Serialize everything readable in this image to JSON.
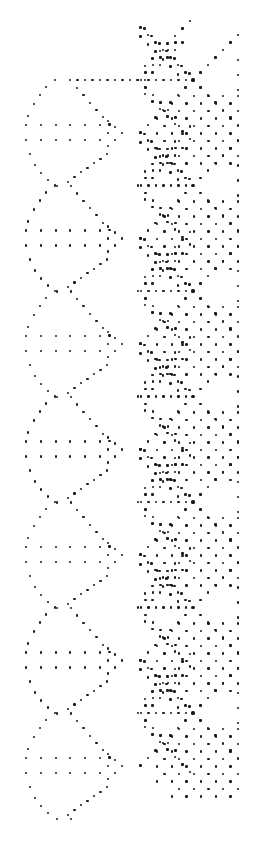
{
  "image": {
    "description": "Bobbin lace pricking pattern: dot grid with diamond motifs",
    "width": 253,
    "height": 844,
    "background": "#ffffff",
    "dot_color": "#1a1a1a"
  },
  "pattern": {
    "period": 105.5,
    "repeats": 7,
    "left_motif": {
      "first_row_y": 125,
      "row_gap": 15,
      "row_x": [
        26,
        41,
        56,
        70,
        85,
        100
      ],
      "tip": [
        122,
        133
      ],
      "inner_right": [
        [
          108,
          121
        ],
        [
          115,
          127
        ],
        [
          108,
          133
        ],
        [
          115,
          140
        ],
        [
          108,
          146
        ]
      ],
      "outline_top_y": 80,
      "outline_left_x": 25,
      "cross_y": 186
    },
    "top_connector": {
      "y": 80,
      "x_start": 55,
      "x_end": 145,
      "step": 7.5
    },
    "right_motif": {
      "center_x": 193,
      "first_center_y": 80,
      "half_width": 48,
      "spacing": 7.5,
      "edge_x": 238
    }
  }
}
